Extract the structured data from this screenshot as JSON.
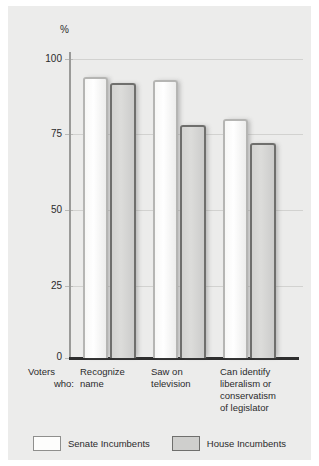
{
  "chart_data": {
    "type": "bar",
    "title": "",
    "xlabel": "",
    "ylabel": "%",
    "ylim": [
      0,
      100
    ],
    "yticks": [
      0,
      25,
      50,
      75,
      100
    ],
    "ytick_labels": [
      "0",
      "25",
      "50",
      "75",
      "100"
    ],
    "grid": true,
    "legend_position": "bottom",
    "row_prefix": "Voters who:",
    "categories": [
      "Recognize name",
      "Saw on television",
      "Can identify liberalism or conservatism of legislator"
    ],
    "category_lines": [
      [
        "Recognize",
        "name"
      ],
      [
        "Saw on",
        "television"
      ],
      [
        "Can identify",
        "liberalism or",
        "conservatism",
        "of legislator"
      ]
    ],
    "series": [
      {
        "name": "Senate Incumbents",
        "color": "#ffffff",
        "values": [
          94,
          93,
          80
        ]
      },
      {
        "name": "House Incumbents",
        "color": "#d3d3d1",
        "values": [
          92,
          78,
          72
        ]
      }
    ]
  },
  "axis": {
    "unit_label": "%",
    "tick_100": "100",
    "tick_75": "75",
    "tick_50": "50",
    "tick_25": "25",
    "tick_0": "0"
  },
  "xlabels": {
    "prefix_line1": "Voters",
    "prefix_line2": "who:",
    "cat1_line1": "Recognize",
    "cat1_line2": "name",
    "cat2_line1": "Saw on",
    "cat2_line2": "television",
    "cat3_line1": "Can identify",
    "cat3_line2": "liberalism or",
    "cat3_line3": "conservatism",
    "cat3_line4": "of legislator"
  },
  "legend": {
    "item1": "Senate Incumbents",
    "item2": "House Incumbents"
  }
}
